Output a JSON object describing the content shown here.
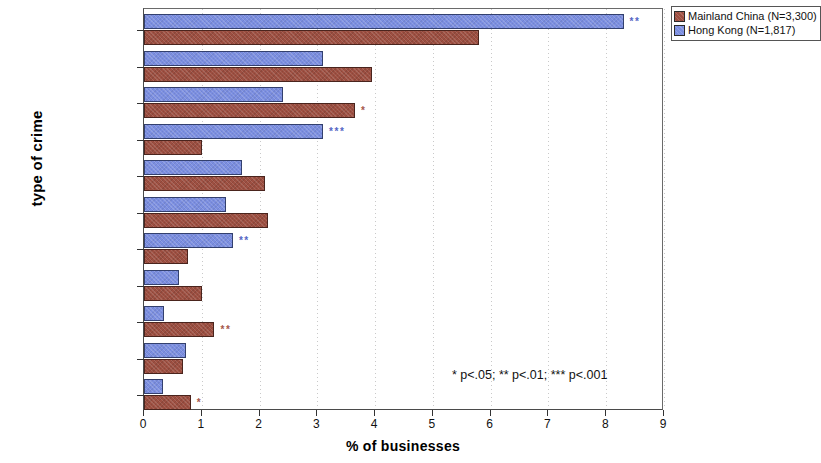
{
  "chart_data": {
    "type": "bar",
    "orientation": "horizontal",
    "title": "",
    "xlabel": "% of businesses",
    "ylabel": "type of crime",
    "xlim": [
      0,
      9
    ],
    "xticks": [
      0,
      1,
      2,
      3,
      4,
      5,
      6,
      7,
      8,
      9
    ],
    "xtick_labels": [
      "0",
      "1",
      "2",
      "3",
      "4",
      "5",
      "6",
      "7",
      "8",
      "9"
    ],
    "grid": true,
    "legend_position": "top-right",
    "categories": [
      "nine crimes",
      "burglary",
      "theft by outsiders",
      "theft by customers",
      "theft by employees",
      "vandalism",
      "other crimes",
      "theft from vehicle",
      "robbery",
      "assault",
      "theft of vehicle"
    ],
    "series": [
      {
        "name": "Mainland China (N=3,300)",
        "color": "#9d4f41",
        "values": [
          5.8,
          3.95,
          3.65,
          1.0,
          2.1,
          2.15,
          0.76,
          1.0,
          1.22,
          0.67,
          0.81
        ],
        "significance": [
          "",
          "",
          "*",
          "",
          "",
          "",
          "",
          "",
          "**",
          "",
          "*"
        ]
      },
      {
        "name": "Hong Kong (N=1,817)",
        "color": "#7b8ee0",
        "values": [
          8.3,
          3.1,
          2.4,
          3.1,
          1.7,
          1.42,
          1.54,
          0.6,
          0.34,
          0.73,
          0.33
        ],
        "significance": [
          "**",
          "",
          "",
          "***",
          "",
          "",
          "**",
          "",
          "",
          "",
          ""
        ]
      }
    ],
    "footnote": "* p<.05; ** p<.01; *** p<.001"
  },
  "legend": {
    "items": [
      {
        "label": "Mainland China (N=3,300)"
      },
      {
        "label": "Hong Kong (N=1,817)"
      }
    ]
  }
}
